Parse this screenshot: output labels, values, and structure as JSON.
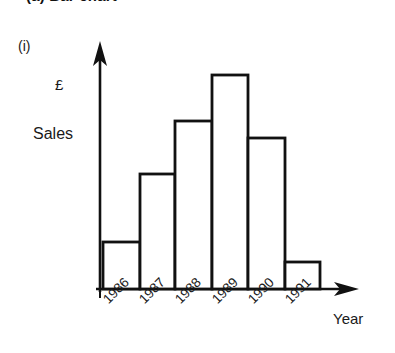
{
  "figure": {
    "title": "(a) Bar chart",
    "part_label": "(i)"
  },
  "chart_data": {
    "type": "bar",
    "title": "(a) Bar chart",
    "subtitle": "(i)",
    "categories": [
      "1986",
      "1987",
      "1988",
      "1989",
      "1990",
      "1991"
    ],
    "values": [
      19,
      41,
      58,
      71,
      54,
      11
    ],
    "xlabel": "Year",
    "ylabel": "Sales",
    "y_unit_label": "£",
    "ylim": [
      0,
      80
    ],
    "xlim_labels": [
      "1986",
      "1991"
    ],
    "grid": false,
    "legend": false,
    "bar_fill": "#ffffff",
    "bar_edge": "#111111",
    "axis_color": "#111111",
    "background": "#ffffff",
    "axis_style": "arrow",
    "tick_label_rotation": -45
  },
  "geometry": {
    "baseline_y": 289,
    "y_axis_x": 100,
    "bars": [
      {
        "label": "1986",
        "x": 103,
        "w": 37,
        "top": 242
      },
      {
        "label": "1987",
        "x": 140,
        "w": 35,
        "top": 174
      },
      {
        "label": "1988",
        "x": 175,
        "w": 37,
        "top": 121
      },
      {
        "label": "1989",
        "x": 212,
        "w": 36,
        "top": 75
      },
      {
        "label": "1990",
        "x": 248,
        "w": 37,
        "top": 138
      },
      {
        "label": "1991",
        "x": 285,
        "w": 35,
        "top": 262
      }
    ],
    "year_label_positions": [
      {
        "label": "1986",
        "x": 100,
        "y": 296
      },
      {
        "label": "1987",
        "x": 136,
        "y": 296
      },
      {
        "label": "1988",
        "x": 172,
        "y": 296
      },
      {
        "label": "1989",
        "x": 209,
        "y": 296
      },
      {
        "label": "1990",
        "x": 245,
        "y": 296
      },
      {
        "label": "1991",
        "x": 282,
        "y": 296
      }
    ]
  }
}
